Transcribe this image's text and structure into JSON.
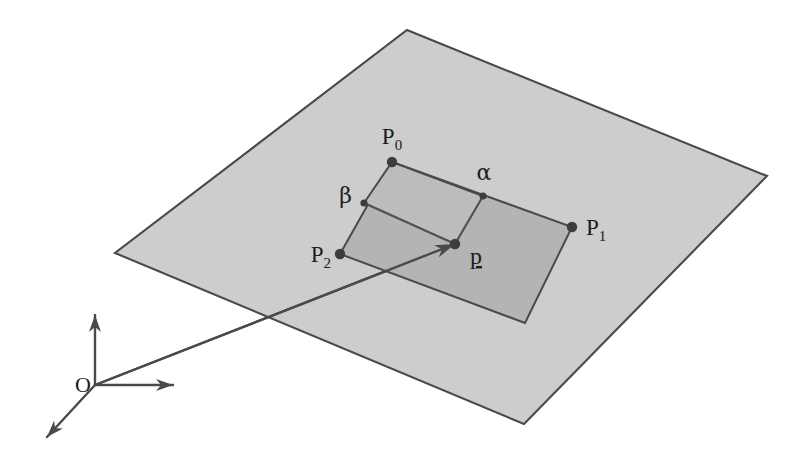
{
  "figure": {
    "type": "geometry-diagram",
    "background_color": "#ffffff",
    "plane": {
      "name": "supporting-plane",
      "fill_color": "#cdcdcd",
      "stroke_color": "#4a4a4a",
      "corners": [
        {
          "x": 407,
          "y": 30
        },
        {
          "x": 767,
          "y": 176
        },
        {
          "x": 524,
          "y": 424
        },
        {
          "x": 115,
          "y": 253
        }
      ]
    },
    "parallelogram": {
      "name": "spanning-parallelogram",
      "fill_color": "#b4b4b4",
      "stroke_color": "#4a4a4a",
      "corners": [
        {
          "x": 392,
          "y": 162
        },
        {
          "x": 572,
          "y": 227
        },
        {
          "x": 525,
          "y": 323
        },
        {
          "x": 340,
          "y": 254
        }
      ]
    },
    "inner_cell": {
      "name": "alpha-beta-cell",
      "fill_color": "#bcbcbc",
      "corners": [
        {
          "x": 392,
          "y": 162
        },
        {
          "x": 483,
          "y": 196
        },
        {
          "x": 455,
          "y": 244
        },
        {
          "x": 364,
          "y": 203
        }
      ]
    },
    "points": [
      {
        "id": "P0",
        "label": "P",
        "subscript": "0",
        "x": 392,
        "y": 162,
        "label_x": 392,
        "label_y": 144,
        "anchor": "middle",
        "dot_r": 5.2
      },
      {
        "id": "P1",
        "label": "P",
        "subscript": "1",
        "x": 572,
        "y": 227,
        "label_x": 586,
        "label_y": 235,
        "anchor": "start",
        "dot_r": 5.2
      },
      {
        "id": "P2",
        "label": "P",
        "subscript": "2",
        "x": 340,
        "y": 254,
        "label_x": 331,
        "label_y": 262,
        "anchor": "end",
        "dot_r": 5.2
      },
      {
        "id": "p",
        "label": "p",
        "subscript": "",
        "x": 455,
        "y": 244,
        "label_x": 470,
        "label_y": 264,
        "anchor": "start",
        "dot_r": 5.2
      }
    ],
    "parameters": [
      {
        "id": "alpha",
        "label": "α",
        "x": 483,
        "y": 196,
        "label_x": 484,
        "label_y": 180,
        "anchor": "middle",
        "dot_r": 3.6
      },
      {
        "id": "beta",
        "label": "β",
        "x": 364,
        "y": 203,
        "label_x": 352,
        "label_y": 203,
        "anchor": "end",
        "dot_r": 3.6
      }
    ],
    "interior_edges": [
      {
        "name": "beta-to-p",
        "x1": 364,
        "y1": 203,
        "x2": 455,
        "y2": 244
      },
      {
        "name": "alpha-to-p",
        "x1": 483,
        "y1": 196,
        "x2": 455,
        "y2": 244
      }
    ],
    "position_vector": {
      "name": "origin-to-p-vector",
      "from": {
        "x": 95,
        "y": 385
      },
      "to": {
        "x": 455,
        "y": 244
      }
    },
    "origin": {
      "label": "O",
      "x": 95,
      "y": 385,
      "label_x": 75,
      "label_y": 392,
      "axes": [
        {
          "name": "y-axis",
          "dx": 0,
          "dy": -70
        },
        {
          "name": "x-axis",
          "dx": 78,
          "dy": 0
        },
        {
          "name": "z-axis",
          "dx": -48,
          "dy": 52
        }
      ]
    }
  }
}
